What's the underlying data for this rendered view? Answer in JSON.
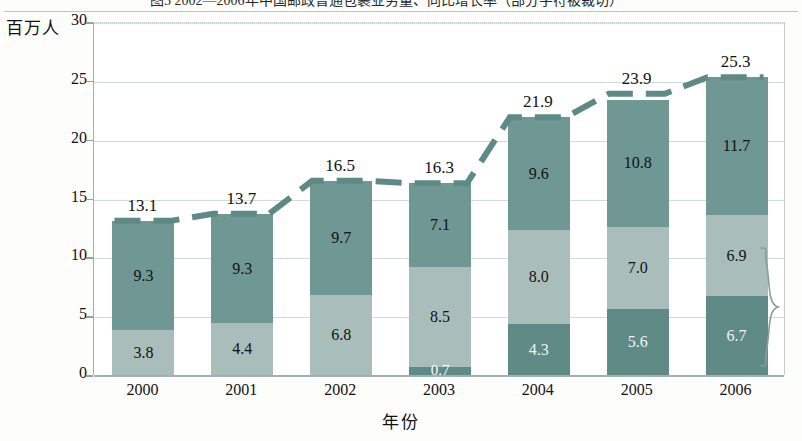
{
  "title": "图5  2002—2006年中国邮政普通包裹业务量、同比增长率（部分字符被裁切）",
  "axis": {
    "y_label": "百万人",
    "x_label": "年份",
    "y_ticks": [
      0,
      5,
      10,
      15,
      20,
      25,
      30
    ],
    "y_min": 0,
    "y_max": 30
  },
  "colors": {
    "segment_top": "#6f9793",
    "segment_middle": "#a9bebb",
    "segment_bottom": "#5f8a86",
    "trend_line": "#5d8a86",
    "gridline": "#cfdcda",
    "axis": "#9fb0b0"
  },
  "chart_data": {
    "type": "bar",
    "stacked": true,
    "title": "",
    "xlabel": "年份",
    "ylabel": "百万人",
    "ylim": [
      0,
      30
    ],
    "yticks": [
      0,
      5,
      10,
      15,
      20,
      25,
      30
    ],
    "grid": true,
    "legend": "none",
    "categories": [
      "2000",
      "2001",
      "2002",
      "2003",
      "2004",
      "2005",
      "2006"
    ],
    "series": [
      {
        "name": "bottom-segment",
        "values": [
          0,
          0,
          0,
          0.7,
          4.3,
          5.6,
          6.7
        ]
      },
      {
        "name": "middle-segment",
        "values": [
          3.8,
          4.4,
          6.8,
          8.5,
          8.0,
          7.0,
          6.9
        ]
      },
      {
        "name": "top-segment",
        "values": [
          9.3,
          9.3,
          9.7,
          7.1,
          9.6,
          10.8,
          11.7
        ]
      }
    ],
    "totals": [
      13.1,
      13.7,
      16.5,
      16.3,
      21.9,
      23.9,
      25.3
    ],
    "overlay": {
      "type": "line",
      "style": "dashed",
      "name": "total-trend",
      "values": [
        13.1,
        13.7,
        16.5,
        16.3,
        21.9,
        23.9,
        25.3
      ]
    },
    "annotations": [
      {
        "name": "right-brace",
        "note": "curly brace spanning lower two segments of 2006 bar"
      }
    ]
  },
  "bars": [
    {
      "year": "2000",
      "total": "13.1",
      "segments": [
        {
          "v": "3.8",
          "cls": "light"
        },
        {
          "v": "9.3",
          "cls": "dark"
        }
      ]
    },
    {
      "year": "2001",
      "total": "13.7",
      "segments": [
        {
          "v": "4.4",
          "cls": "light"
        },
        {
          "v": "9.3",
          "cls": "dark"
        }
      ]
    },
    {
      "year": "2002",
      "total": "16.5",
      "segments": [
        {
          "v": "6.8",
          "cls": "light"
        },
        {
          "v": "9.7",
          "cls": "dark"
        }
      ]
    },
    {
      "year": "2003",
      "total": "16.3",
      "segments": [
        {
          "v": "0.7",
          "cls": "base"
        },
        {
          "v": "8.5",
          "cls": "light"
        },
        {
          "v": "7.1",
          "cls": "dark"
        }
      ]
    },
    {
      "year": "2004",
      "total": "21.9",
      "segments": [
        {
          "v": "4.3",
          "cls": "base"
        },
        {
          "v": "8.0",
          "cls": "light"
        },
        {
          "v": "9.6",
          "cls": "dark"
        }
      ]
    },
    {
      "year": "2005",
      "total": "23.9",
      "segments": [
        {
          "v": "5.6",
          "cls": "base"
        },
        {
          "v": "7.0",
          "cls": "light"
        },
        {
          "v": "10.8",
          "cls": "dark"
        }
      ]
    },
    {
      "year": "2006",
      "total": "25.3",
      "segments": [
        {
          "v": "6.7",
          "cls": "base"
        },
        {
          "v": "6.9",
          "cls": "light"
        },
        {
          "v": "11.7",
          "cls": "dark"
        }
      ]
    }
  ]
}
